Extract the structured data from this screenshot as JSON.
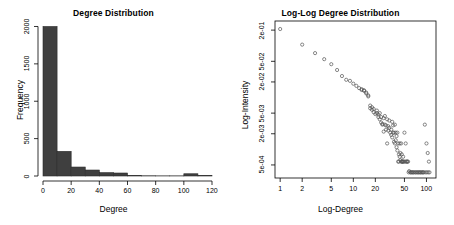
{
  "figure": {
    "background": "#ffffff",
    "bar_color": "#3f3f3f",
    "point_color": "#555555"
  },
  "chart_data": [
    {
      "type": "bar",
      "id": "degree-histogram",
      "title": "Degree Distribution",
      "xlabel": "Degree",
      "ylabel": "Frequency",
      "xlim": [
        0,
        120
      ],
      "ylim": [
        0,
        2060
      ],
      "xticks": [
        0,
        20,
        40,
        60,
        80,
        100,
        120
      ],
      "xticklabels": [
        "0",
        "20",
        "40",
        "60",
        "80",
        "100",
        "120"
      ],
      "yticks": [
        0,
        500,
        1000,
        1500,
        2000
      ],
      "yticklabels": [
        "0",
        "500",
        "1000",
        "1500",
        "2000"
      ],
      "grid": false,
      "legend": "none",
      "bin_width": 10,
      "bin_edges": [
        0,
        10,
        20,
        30,
        40,
        50,
        60,
        70,
        80,
        90,
        100,
        110,
        120
      ],
      "categories": [
        "0-10",
        "10-20",
        "20-30",
        "30-40",
        "40-50",
        "50-60",
        "60-70",
        "70-80",
        "80-90",
        "90-100",
        "100-110",
        "110-120"
      ],
      "values": [
        2000,
        330,
        120,
        80,
        45,
        40,
        5,
        3,
        2,
        2,
        30,
        5
      ]
    },
    {
      "type": "scatter",
      "id": "loglog-degree-distribution",
      "title": "Log-Log Degree Distribution",
      "xlabel": "Log-Degree",
      "ylabel": "Log-Intensity",
      "xscale": "log",
      "yscale": "log",
      "xlim": [
        0.85,
        135
      ],
      "ylim": [
        0.00028,
        0.3
      ],
      "xticks": [
        1,
        2,
        5,
        10,
        20,
        50,
        100
      ],
      "xticklabels": [
        "1",
        "2",
        "5",
        "10",
        "20",
        "50",
        "100"
      ],
      "yticks": [
        0.2,
        0.05,
        0.02,
        0.005,
        0.002,
        0.0005
      ],
      "yticklabels": [
        "2e-01",
        "5e-02",
        "2e-02",
        "5e-03",
        "2e-03",
        "5e-04"
      ],
      "grid": false,
      "legend": "none",
      "marker": "open-circle",
      "x": [
        1,
        2,
        3,
        4,
        5,
        6,
        7,
        8,
        9,
        10,
        11,
        12,
        13,
        14,
        15,
        16,
        17,
        18,
        19,
        20,
        21,
        22,
        23,
        24,
        25,
        26,
        27,
        28,
        29,
        30,
        31,
        32,
        33,
        34,
        35,
        36,
        37,
        38,
        39,
        40,
        41,
        42,
        43,
        44,
        45,
        46,
        47,
        48,
        50,
        52,
        54,
        56,
        58,
        60,
        63,
        66,
        70,
        74,
        78,
        82,
        86,
        90,
        95,
        100,
        104,
        108
      ],
      "y": [
        0.21,
        0.105,
        0.072,
        0.055,
        0.044,
        0.034,
        0.026,
        0.022,
        0.021,
        0.0185,
        0.0168,
        0.0152,
        0.0145,
        0.0138,
        0.0125,
        0.0105,
        0.0062,
        0.0058,
        0.0052,
        0.0048,
        0.0056,
        0.0042,
        0.0038,
        0.0033,
        0.0031,
        0.004,
        0.003,
        0.0029,
        0.0038,
        0.0028,
        0.0026,
        0.0021,
        0.0019,
        0.0017,
        0.0021,
        0.0014,
        0.0013,
        0.0015,
        0.0011,
        0.00095,
        0.0013,
        0.0008,
        0.00072,
        0.00062,
        0.00058,
        0.00058,
        0.00058,
        0.00058,
        0.0021,
        0.0013,
        0.00058,
        0.00058,
        0.00038,
        0.00036,
        0.00036,
        0.00036,
        0.00036,
        0.00036,
        0.00036,
        0.00036,
        0.00036,
        0.00036,
        0.003,
        0.0013,
        0.00085,
        0.00058
      ]
    }
  ]
}
